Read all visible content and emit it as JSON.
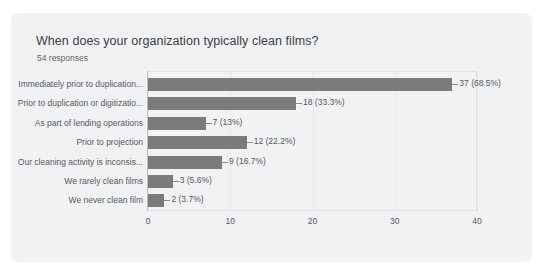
{
  "card": {
    "title": "When does your organization typically clean films?",
    "subtitle": "54 responses"
  },
  "colors": {
    "bar": "#7b7b7b",
    "card_background": "#f1f2f3",
    "page_background": "#ffffff",
    "text": "#55595e",
    "title_text": "#3c4043",
    "gridline": "#e6e7e9",
    "axis": "#bdbfc2"
  },
  "chart_data": {
    "type": "bar",
    "orientation": "horizontal",
    "title": "When does your organization typically clean films?",
    "subtitle": "54 responses",
    "xlabel": "",
    "ylabel": "",
    "xlim": [
      0,
      40
    ],
    "xticks": [
      "0",
      "10",
      "20",
      "30",
      "40"
    ],
    "grid": true,
    "legend": false,
    "total_responses": 54,
    "categories": [
      "Immediately prior to duplication...",
      "Prior to duplication or digitizatio...",
      "As part of lending operations",
      "Prior to projection",
      "Our cleaning activity is inconsis...",
      "We rarely clean films",
      "We never clean film"
    ],
    "values": [
      37,
      18,
      7,
      12,
      9,
      3,
      2
    ],
    "percentages": [
      "68.5%",
      "33.3%",
      "13%",
      "22.2%",
      "16.7%",
      "5.6%",
      "3.7%"
    ],
    "data_labels": [
      "37 (68.5%)",
      "18 (33.3%)",
      "7 (13%)",
      "12 (22.2%)",
      "9 (16.7%)",
      "3 (5.6%)",
      "2 (3.7%)"
    ]
  }
}
